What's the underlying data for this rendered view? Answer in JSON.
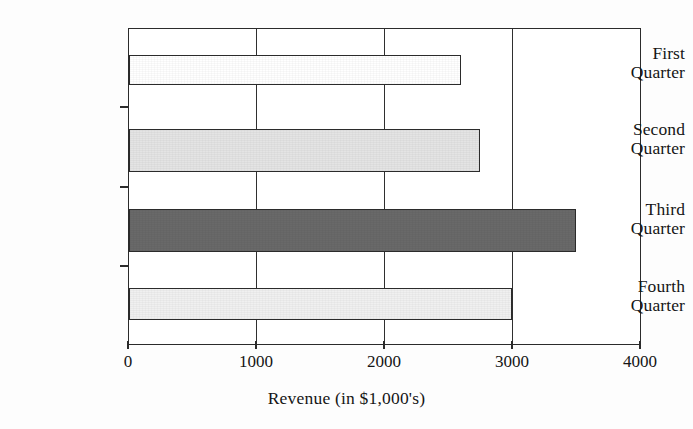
{
  "chart_data": {
    "type": "bar",
    "orientation": "horizontal",
    "title": "",
    "xlabel": "Revenue (in $1,000's)",
    "ylabel": "",
    "xlim": [
      0,
      4000
    ],
    "grid": true,
    "legend": "none",
    "categories": [
      "First Quarter",
      "Second Quarter",
      "Third Quarter",
      "Fourth Quarter"
    ],
    "values": [
      2600,
      2750,
      3500,
      3000
    ],
    "xticks": [
      "0",
      "1000",
      "2000",
      "3000",
      "4000"
    ],
    "xtick_values": [
      0,
      1000,
      2000,
      3000,
      4000
    ],
    "bar_colors": [
      "#ffffff",
      "#e4e4e4",
      "#696969",
      "#f0f0f0"
    ],
    "bar_edge_color": "#2b2b2b",
    "bars": [
      {
        "label_line1": "First",
        "label_line2": "Quarter",
        "value": 2600,
        "color": "#ffffff"
      },
      {
        "label_line1": "Second",
        "label_line2": "Quarter",
        "value": 2750,
        "color": "#e4e4e4"
      },
      {
        "label_line1": "Third",
        "label_line2": "Quarter",
        "value": 3500,
        "color": "#696969"
      },
      {
        "label_line1": "Fourth",
        "label_line2": "Quarter",
        "value": 3000,
        "color": "#f0f0f0"
      }
    ]
  }
}
